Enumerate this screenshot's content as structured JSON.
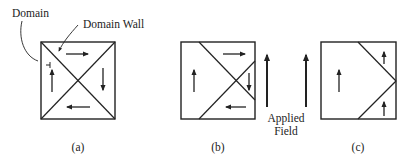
{
  "figure": {
    "annotations": {
      "domain_label": "Domain",
      "domain_wall_label": "Domain Wall"
    },
    "panels": [
      {
        "id": "a",
        "caption": "(a)",
        "description": "Closure domain structure: four triangular domains with circulating magnetization"
      },
      {
        "id": "b",
        "caption": "(b)",
        "description": "Domain walls shift under applied field; up-magnetized domain grows"
      },
      {
        "id": "c",
        "caption": "(c)",
        "description": "Further growth; down domain eliminated"
      }
    ],
    "applied_field": {
      "label_line1": "Applied",
      "label_line2": "Field",
      "direction": "up"
    },
    "colors": {
      "ink": "#222222",
      "background": "#ffffff"
    }
  }
}
